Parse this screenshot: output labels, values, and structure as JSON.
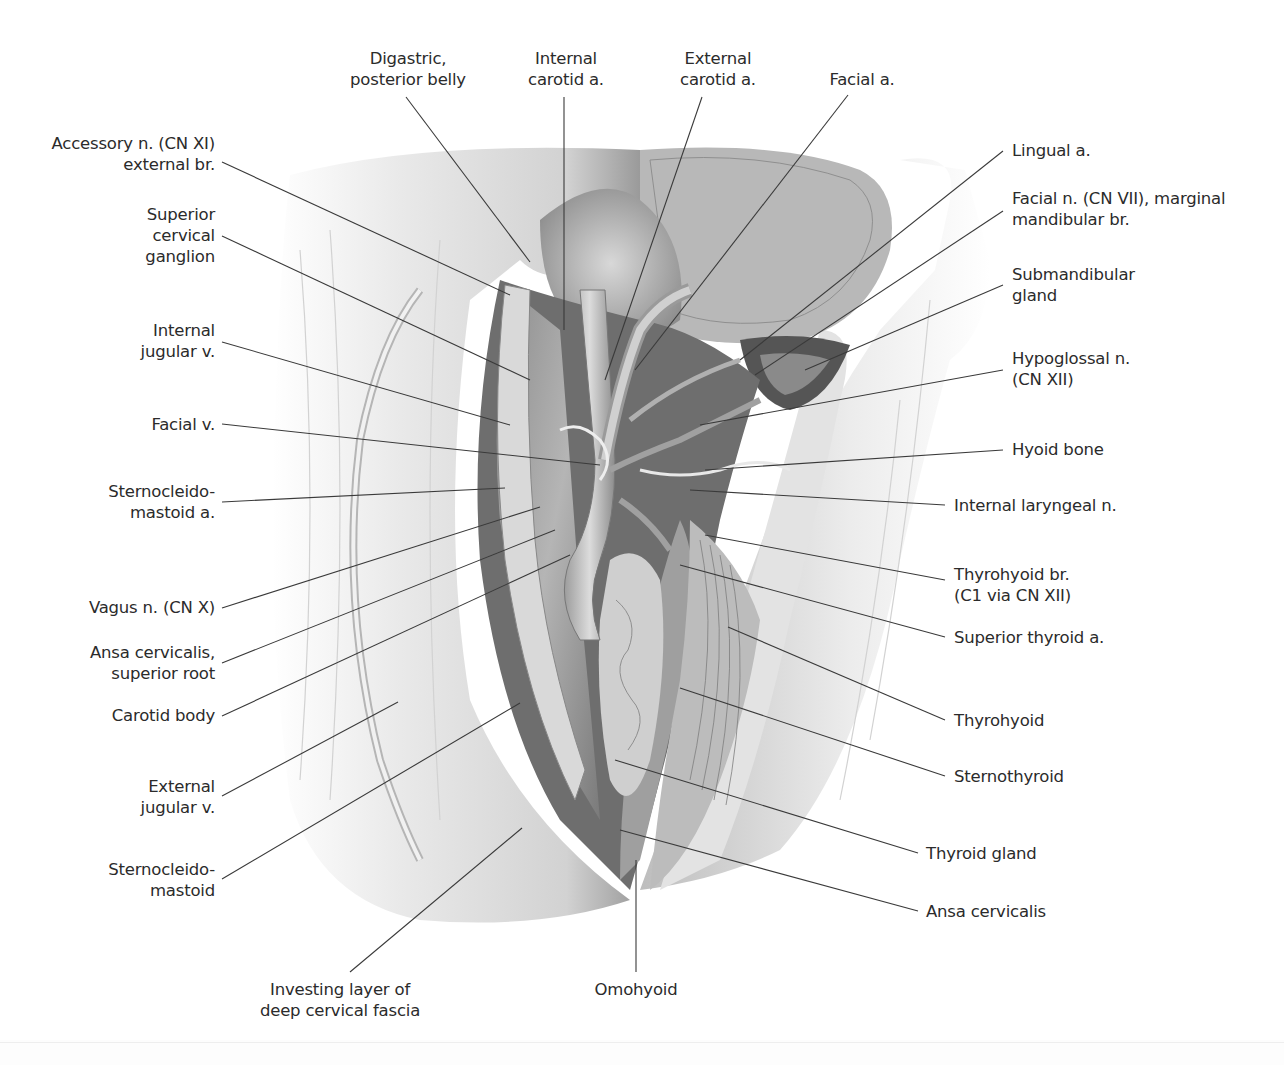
{
  "figure": {
    "colors": {
      "background": "#ffffff",
      "ink": "#2b2b2b",
      "leader": "#3a3a3a",
      "tissue_light": "#e6e6e6",
      "tissue_mid": "#a8a8a8",
      "tissue_dark": "#4a4a4a"
    }
  },
  "labels": {
    "top": [
      {
        "id": "digastric",
        "lines": [
          "Digastric,",
          "posterior belly"
        ]
      },
      {
        "id": "internal-carotid",
        "lines": [
          "Internal",
          "carotid a."
        ]
      },
      {
        "id": "external-carotid",
        "lines": [
          "External",
          "carotid a."
        ]
      },
      {
        "id": "facial-a",
        "lines": [
          "Facial a."
        ]
      }
    ],
    "left": [
      {
        "id": "accessory-n",
        "lines": [
          "Accessory n. (CN XI)",
          "external br."
        ]
      },
      {
        "id": "superior-cervical-ganglion",
        "lines": [
          "Superior",
          "cervical",
          "ganglion"
        ]
      },
      {
        "id": "internal-jugular-v",
        "lines": [
          "Internal",
          "jugular v."
        ]
      },
      {
        "id": "facial-v",
        "lines": [
          "Facial v."
        ]
      },
      {
        "id": "sternocleidomastoid-a",
        "lines": [
          "Sternocleido-",
          "mastoid a."
        ]
      },
      {
        "id": "vagus-n",
        "lines": [
          "Vagus n. (CN X)"
        ]
      },
      {
        "id": "ansa-superior-root",
        "lines": [
          "Ansa cervicalis,",
          "superior root"
        ]
      },
      {
        "id": "carotid-body",
        "lines": [
          "Carotid body"
        ]
      },
      {
        "id": "external-jugular-v",
        "lines": [
          "External",
          "jugular v."
        ]
      },
      {
        "id": "sternocleidomastoid",
        "lines": [
          "Sternocleido-",
          "mastoid"
        ]
      }
    ],
    "right": [
      {
        "id": "lingual-a",
        "lines": [
          "Lingual a."
        ]
      },
      {
        "id": "facial-n",
        "lines": [
          "Facial n. (CN VII), marginal",
          "mandibular br."
        ]
      },
      {
        "id": "submandibular-gland",
        "lines": [
          "Submandibular",
          "gland"
        ]
      },
      {
        "id": "hypoglossal-n",
        "lines": [
          "Hypoglossal n.",
          "(CN XII)"
        ]
      },
      {
        "id": "hyoid-bone",
        "lines": [
          "Hyoid bone"
        ]
      },
      {
        "id": "internal-laryngeal-n",
        "lines": [
          "Internal laryngeal n."
        ]
      },
      {
        "id": "thyrohyoid-br",
        "lines": [
          "Thyrohyoid br.",
          "(C1 via CN XII)"
        ]
      },
      {
        "id": "superior-thyroid-a",
        "lines": [
          "Superior thyroid a."
        ]
      },
      {
        "id": "thyrohyoid",
        "lines": [
          "Thyrohyoid"
        ]
      },
      {
        "id": "sternothyroid",
        "lines": [
          "Sternothyroid"
        ]
      },
      {
        "id": "thyroid-gland",
        "lines": [
          "Thyroid gland"
        ]
      },
      {
        "id": "ansa-cervicalis",
        "lines": [
          "Ansa cervicalis"
        ]
      }
    ],
    "bottom": [
      {
        "id": "investing-layer",
        "lines": [
          "Investing layer of",
          "deep cervical fascia"
        ]
      },
      {
        "id": "omohyoid",
        "lines": [
          "Omohyoid"
        ]
      }
    ]
  }
}
